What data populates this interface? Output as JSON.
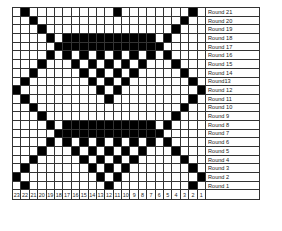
{
  "chart": {
    "columns": [
      "23",
      "22",
      "21",
      "20",
      "19",
      "18",
      "17",
      "16",
      "15",
      "14",
      "13",
      "12",
      "11",
      "10",
      "9",
      "8",
      "7",
      "6",
      "5",
      "4",
      "3",
      "2",
      "1"
    ],
    "rows": [
      {
        "label": "Round 21",
        "filled": [
          1,
          12,
          21
        ]
      },
      {
        "label": "Round 20",
        "filled": [
          2,
          20
        ]
      },
      {
        "label": "Round 19",
        "filled": [
          3,
          19
        ]
      },
      {
        "label": "Round 18",
        "filled": [
          4,
          6,
          7,
          8,
          9,
          10,
          11,
          12,
          13,
          14,
          15,
          16,
          18
        ]
      },
      {
        "label": "Round 17",
        "filled": [
          5,
          6,
          7,
          8,
          9,
          10,
          11,
          12,
          13,
          14,
          15,
          16,
          17
        ]
      },
      {
        "label": "Round 16",
        "filled": [
          4,
          6,
          8,
          10,
          12,
          14,
          16,
          18
        ]
      },
      {
        "label": "Round 15",
        "filled": [
          3,
          7,
          9,
          11,
          13,
          15,
          19
        ]
      },
      {
        "label": "Round 14",
        "filled": [
          2,
          8,
          10,
          12,
          14,
          20
        ]
      },
      {
        "label": "Round13",
        "filled": [
          1,
          9,
          11,
          13,
          21
        ]
      },
      {
        "label": "Round 12",
        "filled": [
          0,
          10,
          12,
          22
        ]
      },
      {
        "label": "Round 11",
        "filled": [
          1,
          11,
          21
        ]
      },
      {
        "label": "Round 10",
        "filled": [
          2,
          20
        ]
      },
      {
        "label": "Round 9",
        "filled": [
          3,
          19
        ]
      },
      {
        "label": "Round 8",
        "filled": [
          4,
          6,
          7,
          8,
          9,
          10,
          11,
          12,
          13,
          14,
          15,
          16,
          18
        ]
      },
      {
        "label": "Round 7",
        "filled": [
          5,
          6,
          7,
          8,
          9,
          10,
          11,
          12,
          13,
          14,
          15,
          16,
          17
        ]
      },
      {
        "label": "Round 6",
        "filled": [
          4,
          6,
          8,
          10,
          12,
          14,
          16,
          18
        ]
      },
      {
        "label": "Round 5",
        "filled": [
          3,
          7,
          9,
          11,
          13,
          15,
          19
        ]
      },
      {
        "label": "Round 4",
        "filled": [
          2,
          8,
          10,
          12,
          14,
          20
        ]
      },
      {
        "label": "Round 3",
        "filled": [
          1,
          9,
          11,
          13,
          21
        ]
      },
      {
        "label": "Round 2",
        "filled": [
          0,
          10,
          12,
          22
        ]
      },
      {
        "label": "Round 1",
        "filled": [
          1,
          11,
          21
        ]
      }
    ]
  }
}
